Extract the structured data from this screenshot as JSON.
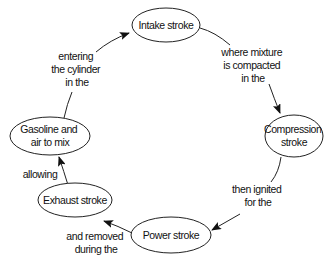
{
  "diagram": {
    "type": "cycle-concept-map",
    "colors": {
      "stroke": "#222222",
      "text": "#111111",
      "background": "#ffffff"
    },
    "nodes": [
      {
        "id": "intake",
        "lines": [
          "Intake stroke"
        ]
      },
      {
        "id": "compression",
        "lines": [
          "Compression",
          "stroke"
        ]
      },
      {
        "id": "power",
        "lines": [
          "Power stroke"
        ]
      },
      {
        "id": "exhaust",
        "lines": [
          "Exhaust stroke"
        ]
      },
      {
        "id": "gasoline",
        "lines": [
          "Gasoline and",
          "air to mix"
        ]
      }
    ],
    "edges": [
      {
        "id": "intake-to-compression",
        "from": "intake",
        "to": "compression",
        "lines": [
          "where mixture",
          "is compacted",
          "in the"
        ]
      },
      {
        "id": "compression-to-power",
        "from": "compression",
        "to": "power",
        "lines": [
          "then ignited",
          "for the"
        ]
      },
      {
        "id": "power-to-exhaust",
        "from": "power",
        "to": "exhaust",
        "lines": [
          "and removed",
          "during the"
        ]
      },
      {
        "id": "exhaust-to-gasoline",
        "from": "exhaust",
        "to": "gasoline",
        "lines": [
          "allowing"
        ]
      },
      {
        "id": "gasoline-to-intake",
        "from": "gasoline",
        "to": "intake",
        "lines": [
          "entering",
          "the cylinder",
          "in the"
        ]
      }
    ]
  }
}
